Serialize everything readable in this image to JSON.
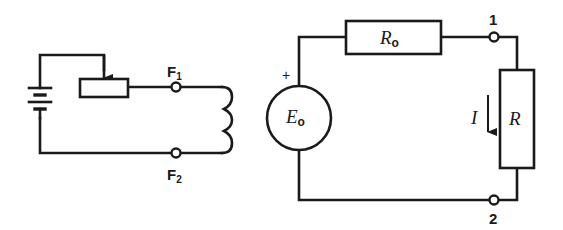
{
  "diagram": {
    "type": "electric circuit schematics",
    "left_circuit": {
      "description": "Field excitation circuit: battery, rheostat, field winding",
      "terminal_top": {
        "label": "F",
        "subscript": "1"
      },
      "terminal_bottom": {
        "label": "F",
        "subscript": "2"
      },
      "components": [
        "battery",
        "rheostat",
        "field-coil"
      ]
    },
    "right_circuit": {
      "description": "Equivalent circuit: EMF source with internal resistance and load",
      "source": {
        "label": "E",
        "subscript": "o",
        "polarity": "+"
      },
      "internal_resistor": {
        "label": "R",
        "subscript": "o"
      },
      "load_resistor": {
        "label": "R"
      },
      "current": {
        "label": "I",
        "direction": "down"
      },
      "terminal_top": {
        "label": "1"
      },
      "terminal_bottom": {
        "label": "2"
      }
    },
    "colors": {
      "line": "#1a1a1a",
      "background": "#ffffff"
    }
  }
}
